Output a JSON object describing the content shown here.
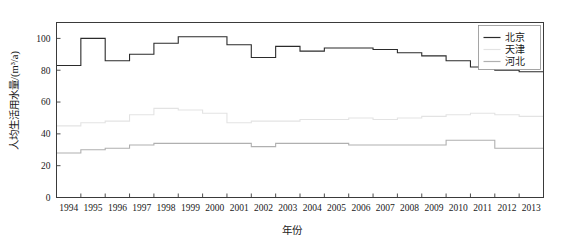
{
  "chart_data": {
    "type": "line",
    "style": "step-post",
    "title": "",
    "subtitle": "",
    "xlabel": "年份",
    "ylabel": "人均生活用水量/(m³/a)",
    "x": [
      1994,
      1995,
      1996,
      1997,
      1998,
      1999,
      2000,
      2001,
      2002,
      2003,
      2004,
      2005,
      2006,
      2007,
      2008,
      2009,
      2010,
      2011,
      2012,
      2013
    ],
    "xticklabels": [
      "1994",
      "1995",
      "1996",
      "1997",
      "1998",
      "1999",
      "2000",
      "2001",
      "2002",
      "2003",
      "2004",
      "2005",
      "2006",
      "2007",
      "2008",
      "2009",
      "2010",
      "2011",
      "2012",
      "2013"
    ],
    "yticklabels": [
      "0",
      "20",
      "40",
      "60",
      "80",
      "100"
    ],
    "yticks": [
      0,
      20,
      40,
      60,
      80,
      100
    ],
    "ylim": [
      0,
      110
    ],
    "xlim": [
      1994,
      2014
    ],
    "grid": false,
    "legend_position": "top-right",
    "series": [
      {
        "name": "北京",
        "color": "#2b2b2b",
        "values": [
          83,
          100,
          86,
          90,
          97,
          101,
          101,
          96,
          88,
          95,
          92,
          94,
          94,
          93,
          91,
          89,
          86,
          82,
          80,
          79
        ]
      },
      {
        "name": "天津",
        "color": "#e3e3e3",
        "values": [
          45,
          47,
          48,
          52,
          56,
          55,
          53,
          47,
          48,
          48,
          49,
          49,
          50,
          49,
          50,
          51,
          52,
          53,
          52,
          51
        ]
      },
      {
        "name": "河北",
        "color": "#b0b0b0",
        "values": [
          28,
          30,
          31,
          33,
          34,
          34,
          34,
          34,
          32,
          34,
          34,
          34,
          33,
          33,
          33,
          33,
          36,
          36,
          31,
          31
        ]
      }
    ]
  },
  "legend": {
    "entries": [
      {
        "label": "北京"
      },
      {
        "label": "天津"
      },
      {
        "label": "河北"
      }
    ]
  },
  "axes": {
    "x_title": "年份",
    "y_title": "人均生活用水量/(m³/a)"
  }
}
